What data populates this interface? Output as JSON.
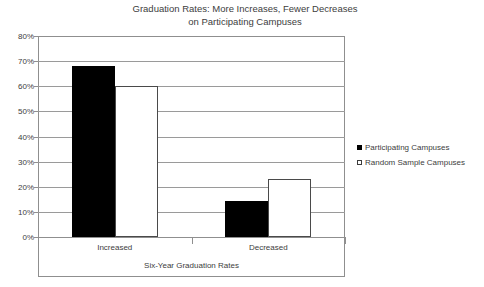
{
  "chart_data": {
    "type": "bar",
    "title": "Graduation Rates: More Increases, Fewer Decreases\non Participating Campuses",
    "title_line1": "Graduation Rates: More Increases, Fewer Decreases",
    "title_line2": "on Participating Campuses",
    "xlabel": "Six-Year Graduation Rates",
    "ylabel": "",
    "categories": [
      "Increased",
      "Decreased"
    ],
    "series": [
      {
        "name": "Participating Campuses",
        "values": [
          68,
          14.5
        ],
        "color": "#000000",
        "swatch": "filled"
      },
      {
        "name": "Random Sample Campuses",
        "values": [
          60,
          23
        ],
        "color": "#ffffff",
        "swatch": "hollow"
      }
    ],
    "ylim": [
      0,
      80
    ],
    "ytick_values": [
      80,
      70,
      60,
      50,
      40,
      30,
      20,
      10,
      0
    ],
    "ytick_labels": [
      "80%",
      "70%",
      "60%",
      "50%",
      "40%",
      "30%",
      "20%",
      "10%",
      "0%"
    ],
    "grid": true,
    "grid_axis": "y",
    "legend_position": "right",
    "value_suffix": "%"
  },
  "legend": {
    "items": [
      {
        "label": "Participating Campuses",
        "swatch": "filled"
      },
      {
        "label": "Random Sample Campuses",
        "swatch": "hollow"
      }
    ]
  },
  "colors": {
    "series_participating": "#000000",
    "series_random": "#ffffff",
    "gridline": "#9a9a9a",
    "frame": "#8f8f8f",
    "text": "#3d3d3d",
    "background": "#ffffff"
  }
}
